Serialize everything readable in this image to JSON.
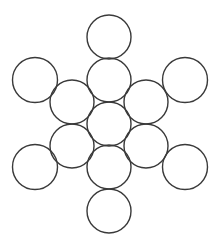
{
  "diagram": {
    "width": 224,
    "height": 247,
    "background": "#ffffff",
    "stroke_color": "#3a3a3a",
    "stroke_width": 1.4,
    "circles": [
      {
        "id": "top",
        "cx": 109,
        "cy": 37,
        "r": 22
      },
      {
        "id": "upper-left-outer",
        "cx": 35,
        "cy": 80,
        "r": 22.5
      },
      {
        "id": "upper-right-outer",
        "cx": 185,
        "cy": 80,
        "r": 22.5
      },
      {
        "id": "center-upper",
        "cx": 109,
        "cy": 80,
        "r": 22
      },
      {
        "id": "left-upper-inner",
        "cx": 72,
        "cy": 102,
        "r": 22
      },
      {
        "id": "right-upper-inner",
        "cx": 146,
        "cy": 102,
        "r": 22
      },
      {
        "id": "center",
        "cx": 109,
        "cy": 124,
        "r": 22
      },
      {
        "id": "left-lower-inner",
        "cx": 72,
        "cy": 146,
        "r": 22
      },
      {
        "id": "right-lower-inner",
        "cx": 146,
        "cy": 146,
        "r": 22
      },
      {
        "id": "center-lower",
        "cx": 109,
        "cy": 167,
        "r": 22
      },
      {
        "id": "lower-left-outer",
        "cx": 35,
        "cy": 167,
        "r": 22.5
      },
      {
        "id": "lower-right-outer",
        "cx": 185,
        "cy": 167,
        "r": 22.5
      },
      {
        "id": "bottom",
        "cx": 109,
        "cy": 211,
        "r": 22
      }
    ]
  }
}
